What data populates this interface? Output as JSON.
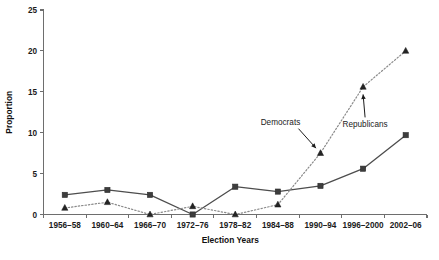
{
  "chart_data": {
    "type": "line",
    "title": "",
    "xlabel": "Election Years",
    "ylabel": "Proportion",
    "ylim": [
      0,
      25
    ],
    "yticks": [
      0,
      5,
      10,
      15,
      20,
      25
    ],
    "ytick_labels": [
      "0",
      "5",
      "10",
      "15",
      "20",
      "25"
    ],
    "grid": false,
    "legend_position": "inline-annotations",
    "categories": [
      "1956–58",
      "1960–64",
      "1966–70",
      "1972–76",
      "1978–82",
      "1984–88",
      "1990–94",
      "1996–2000",
      "2002–06"
    ],
    "series": [
      {
        "name": "Republicans",
        "marker": "square",
        "linestyle": "solid",
        "color": "#4d4d4d",
        "values": [
          2.4,
          3.0,
          2.4,
          0.0,
          3.4,
          2.8,
          3.5,
          5.6,
          9.7
        ]
      },
      {
        "name": "Democrats",
        "marker": "triangle",
        "linestyle": "dotted",
        "color": "#8a8a8a",
        "values": [
          0.8,
          1.5,
          0.0,
          1.0,
          0.0,
          1.2,
          7.5,
          15.6,
          20.0
        ]
      }
    ],
    "annotations": [
      {
        "text": "Democrats",
        "target_series": "Democrats",
        "target_category": "1990–94"
      },
      {
        "text": "Republicans",
        "target_series": "Democrats",
        "target_category": "1996–2000"
      }
    ]
  },
  "colors": {
    "background": "#ffffff",
    "axis": "#6e6e6e",
    "text": "#1b1b1b",
    "republicans": "#4d4d4d",
    "democrats": "#8a8a8a"
  }
}
